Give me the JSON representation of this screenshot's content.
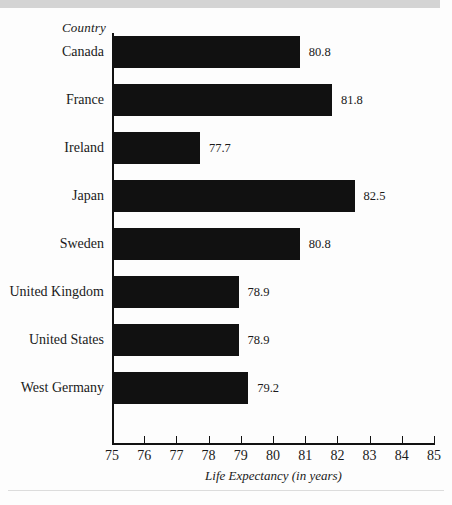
{
  "chart_data": {
    "type": "bar",
    "orientation": "horizontal",
    "title": "",
    "ylabel": "Country",
    "xlabel": "Life Expectancy (in years)",
    "categories": [
      "Canada",
      "France",
      "Ireland",
      "Japan",
      "Sweden",
      "United Kingdom",
      "United States",
      "West Germany"
    ],
    "values": [
      80.8,
      81.8,
      77.7,
      82.5,
      80.8,
      78.9,
      78.9,
      79.2
    ],
    "value_labels": [
      "80.8",
      "81.8",
      "77.7",
      "82.5",
      "80.8",
      "78.9",
      "78.9",
      "79.2"
    ],
    "xlim": [
      75,
      85
    ],
    "xticks": [
      75,
      76,
      77,
      78,
      79,
      80,
      81,
      82,
      83,
      84,
      85
    ],
    "xtick_labels": [
      "75",
      "76",
      "77",
      "78",
      "79",
      "80",
      "81",
      "82",
      "83",
      "84",
      "85"
    ],
    "grid": false,
    "legend": false,
    "bar_color": "#111111",
    "background_color": "#fdfdfd"
  },
  "decor": {
    "top_strip_color": "#d4d4d4",
    "footer_rule_color": "#dcdcdc"
  }
}
